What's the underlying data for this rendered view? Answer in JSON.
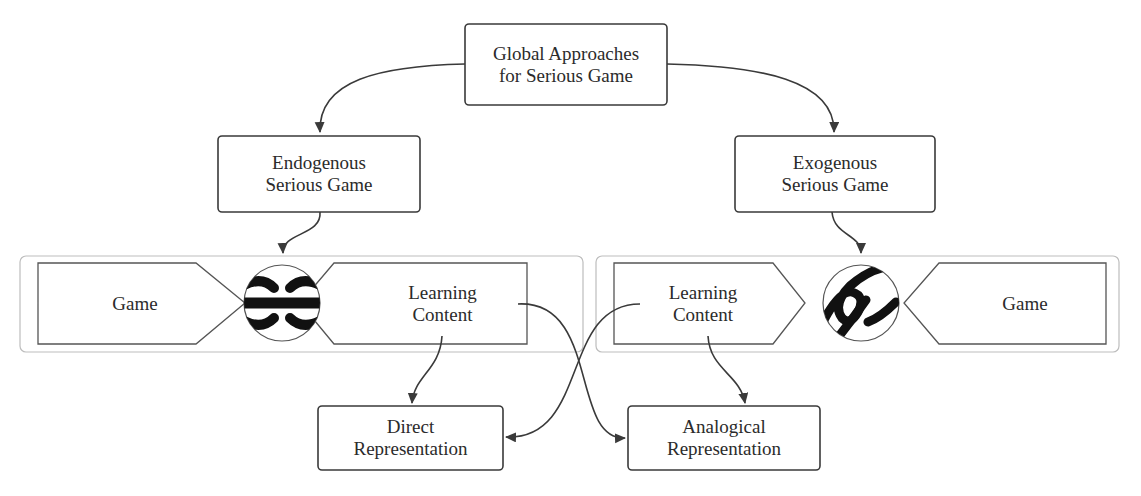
{
  "diagram": {
    "root": {
      "label": "Global Approaches\nfor Serious Game"
    },
    "branches": [
      {
        "label": "Endogenous\nSerious Game",
        "group": {
          "left_block": "Game",
          "right_block": "Learning\nContent",
          "connector_icon": "interlocked-hooks-icon"
        }
      },
      {
        "label": "Exogenous\nSerious Game",
        "group": {
          "left_block": "Learning\nContent",
          "right_block": "Game",
          "connector_icon": "loose-hooks-icon"
        }
      }
    ],
    "outputs": [
      {
        "label": "Direct\nRepresentation"
      },
      {
        "label": "Analogical\nRepresentation"
      }
    ],
    "edges": [
      {
        "from": "Global Approaches for Serious Game",
        "to": "Endogenous Serious Game"
      },
      {
        "from": "Global Approaches for Serious Game",
        "to": "Exogenous Serious Game"
      },
      {
        "from": "Endogenous Serious Game",
        "to": "Endogenous group"
      },
      {
        "from": "Exogenous Serious Game",
        "to": "Exogenous group"
      },
      {
        "from": "Endogenous Learning Content",
        "to": "Direct Representation"
      },
      {
        "from": "Endogenous Learning Content",
        "to": "Analogical Representation"
      },
      {
        "from": "Exogenous Learning Content",
        "to": "Direct Representation"
      },
      {
        "from": "Exogenous Learning Content",
        "to": "Analogical Representation"
      }
    ],
    "colors": {
      "stroke": "#3a3a3a",
      "group_border": "#b8b8b8",
      "text": "#2b2b2b",
      "background": "#ffffff"
    }
  }
}
